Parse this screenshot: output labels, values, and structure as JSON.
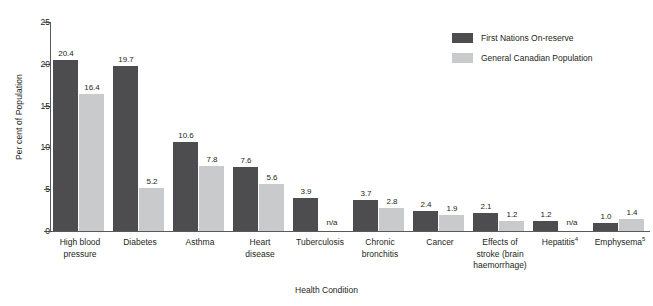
{
  "chart_data": {
    "type": "bar",
    "title": "",
    "xlabel": "Health Condition",
    "ylabel": "Per cent of Population",
    "ylim": [
      0,
      25
    ],
    "yticks": [
      "0",
      "5",
      "10",
      "15",
      "20",
      "25"
    ],
    "grid": false,
    "legend_position": "top-right",
    "na_text": "n/a",
    "categories": [
      "High blood pressure",
      "Diabetes",
      "Asthma",
      "Heart disease",
      "Tuberculosis",
      "Chronic bronchitis",
      "Cancer",
      "Effects of stroke (brain haemorrhage)",
      "Hepatitis",
      "Emphysema"
    ],
    "category_labels": [
      {
        "line1": "High blood",
        "line2": "pressure",
        "line3": "",
        "footnote": ""
      },
      {
        "line1": "Diabetes",
        "line2": "",
        "line3": "",
        "footnote": ""
      },
      {
        "line1": "Asthma",
        "line2": "",
        "line3": "",
        "footnote": ""
      },
      {
        "line1": "Heart",
        "line2": "disease",
        "line3": "",
        "footnote": ""
      },
      {
        "line1": "Tuberculosis",
        "line2": "",
        "line3": "",
        "footnote": ""
      },
      {
        "line1": "Chronic",
        "line2": "bronchitis",
        "line3": "",
        "footnote": ""
      },
      {
        "line1": "Cancer",
        "line2": "",
        "line3": "",
        "footnote": ""
      },
      {
        "line1": "Effects of",
        "line2": "stroke (brain",
        "line3": "haemorrhage)",
        "footnote": ""
      },
      {
        "line1": "Hepatitis",
        "line2": "",
        "line3": "",
        "footnote": "4"
      },
      {
        "line1": "Emphysema",
        "line2": "",
        "line3": "",
        "footnote": "5"
      }
    ],
    "series": [
      {
        "name": "First Nations On-reserve",
        "color": "#4d4d4f",
        "values": [
          20.4,
          19.7,
          10.6,
          7.6,
          3.9,
          3.7,
          2.4,
          2.1,
          1.2,
          1.0
        ],
        "labels": [
          "20.4",
          "19.7",
          "10.6",
          "7.6",
          "3.9",
          "3.7",
          "2.4",
          "2.1",
          "1.2",
          "1.0"
        ]
      },
      {
        "name": "General Canadian Population",
        "color": "#c9cacb",
        "values": [
          16.4,
          5.2,
          7.8,
          5.6,
          null,
          2.8,
          1.9,
          1.2,
          null,
          1.4
        ],
        "labels": [
          "16.4",
          "5.2",
          "7.8",
          "5.6",
          "n/a",
          "2.8",
          "1.9",
          "1.2",
          "n/a",
          "1.4"
        ]
      }
    ]
  },
  "axes": {
    "y_title": "Per cent of Population",
    "x_title": "Health Condition"
  },
  "legend": {
    "items": [
      {
        "label": "First Nations On-reserve",
        "color": "#4d4d4f"
      },
      {
        "label": "General Canadian Population",
        "color": "#c9cacb"
      }
    ]
  },
  "colors": {
    "dark_bar": "#4d4d4f",
    "light_bar": "#c9cacb",
    "axis": "#58595b",
    "text": "#231f20",
    "background": "#ffffff"
  }
}
